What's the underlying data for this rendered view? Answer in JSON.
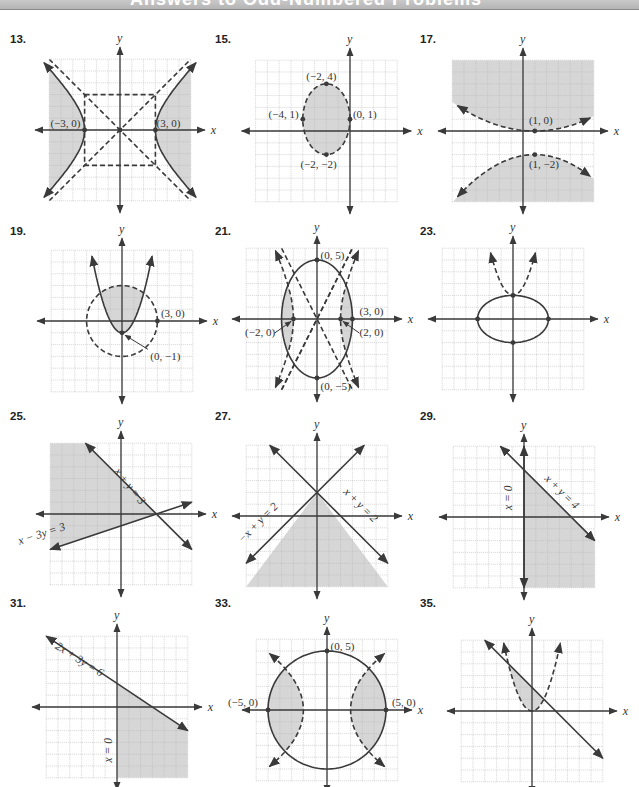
{
  "header": {
    "title": "Answers to Odd-Numbered Problems"
  },
  "colors": {
    "grid": "#b8b8b8",
    "axis": "#3a3a3a",
    "curve": "#3a3a3a",
    "shade": "#d6d6d6",
    "label": "#333333"
  },
  "chart_data": [
    {
      "id": "13",
      "type": "inequality-graph",
      "title": "13.",
      "panel": {
        "left": 10,
        "top": 33
      },
      "origin": [
        110,
        97
      ],
      "unit": 11.8,
      "grid": [
        -6,
        6,
        -6,
        6
      ],
      "xlabel": "x",
      "ylabel": "y",
      "description": "Hyperbola x^2/9 - y^2/b^2 = 1 (solid), shaded outside branches, dashed asymptote box and asymptotes",
      "points": [
        {
          "x": -3,
          "y": 0,
          "label": "(−3, 0)",
          "lx": -5.9,
          "ly": 0.25
        },
        {
          "x": 3,
          "y": 0,
          "label": "(3, 0)",
          "lx": 3.1,
          "ly": 0.25
        },
        {
          "x": 0,
          "y": 0,
          "label": ""
        }
      ]
    },
    {
      "id": "15",
      "type": "inequality-graph",
      "title": "15.",
      "panel": {
        "left": 215,
        "top": 33
      },
      "origin": [
        135,
        98
      ],
      "unit": 11.8,
      "grid": [
        -8,
        4,
        -6,
        6
      ],
      "xlabel": "x",
      "ylabel": "y",
      "description": "Dashed ellipse centered (-2,1), shaded interior",
      "points": [
        {
          "x": -2,
          "y": 4,
          "label": "(−2, 4)",
          "lx": -3.7,
          "ly": 4.3
        },
        {
          "x": -4,
          "y": 1,
          "label": "(−4, 1)",
          "lx": -6.9,
          "ly": 1.1
        },
        {
          "x": 0,
          "y": 1,
          "label": "(0, 1)",
          "lx": 0.25,
          "ly": 1.1
        },
        {
          "x": -2,
          "y": -2,
          "label": "(−2, −2)",
          "lx": -4.2,
          "ly": -3.1
        }
      ]
    },
    {
      "id": "17",
      "type": "inequality-graph",
      "title": "17.",
      "panel": {
        "left": 420,
        "top": 33
      },
      "origin": [
        103,
        98
      ],
      "unit": 11.8,
      "grid": [
        -6,
        6,
        -6,
        6
      ],
      "xlabel": "x",
      "ylabel": "y",
      "description": "Two dashed parabola-like curves; shaded above upper curve and below lower curve",
      "points": [
        {
          "x": 1,
          "y": 0,
          "label": "(1, 0)",
          "lx": 0.5,
          "ly": 0.6
        },
        {
          "x": 1,
          "y": -2,
          "label": "(1, −2)",
          "lx": 0.5,
          "ly": -3.1
        }
      ]
    },
    {
      "id": "19",
      "type": "inequality-graph",
      "title": "19.",
      "panel": {
        "left": 10,
        "top": 225
      },
      "origin": [
        112,
        96
      ],
      "unit": 11.8,
      "grid": [
        -6,
        6,
        -6,
        6
      ],
      "xlabel": "x",
      "ylabel": "y",
      "description": "Solid parabola y = x^2 - 1, dashed circle radius 3; shaded inside circle above parabola",
      "points": [
        {
          "x": 3,
          "y": 0,
          "label": "(3, 0)",
          "lx": 3.3,
          "ly": 0.3
        },
        {
          "x": 0,
          "y": -1,
          "label": "(0, −1)",
          "lx": 2.4,
          "ly": -3.3
        }
      ]
    },
    {
      "id": "21",
      "type": "inequality-graph",
      "title": "21.",
      "panel": {
        "left": 215,
        "top": 225
      },
      "origin": [
        102,
        94
      ],
      "unit": 11.8,
      "grid": [
        -6,
        6,
        -6,
        6
      ],
      "xlabel": "x",
      "ylabel": "y",
      "description": "Solid ellipse x^2/9 + y^2/25 = 1, dashed hyperbola branches through (±2,0); shaded regions between",
      "points": [
        {
          "x": 0,
          "y": 5,
          "label": "(0, 5)",
          "lx": 0.3,
          "ly": 5.1
        },
        {
          "x": 3,
          "y": 0,
          "label": "(3, 0)",
          "lx": 3.6,
          "ly": 0.3
        },
        {
          "x": -2,
          "y": 0,
          "label": "(−2, 0)",
          "lx": -6.1,
          "ly": -1.4
        },
        {
          "x": 2,
          "y": 0,
          "label": "(2, 0)",
          "lx": 3.6,
          "ly": -1.4
        },
        {
          "x": 0,
          "y": -5,
          "label": "(0, −5)",
          "lx": 0.3,
          "ly": -6.0
        }
      ]
    },
    {
      "id": "23",
      "type": "inequality-graph",
      "title": "23.",
      "panel": {
        "left": 420,
        "top": 225
      },
      "origin": [
        93,
        94
      ],
      "unit": 11.8,
      "grid": [
        -6,
        6,
        -6,
        6
      ],
      "xlabel": "x",
      "ylabel": "y",
      "description": "Solid ellipse x^2/9 + y^2/4 = 1, dashed parabola y = x^2 + 2 above",
      "points": [
        {
          "x": 0,
          "y": 2,
          "label": ""
        },
        {
          "x": -3,
          "y": 0,
          "label": ""
        },
        {
          "x": 3,
          "y": 0,
          "label": ""
        },
        {
          "x": 0,
          "y": -2,
          "label": ""
        }
      ]
    },
    {
      "id": "25",
      "type": "inequality-graph",
      "title": "25.",
      "panel": {
        "left": 10,
        "top": 410
      },
      "origin": [
        111,
        104
      ],
      "unit": 11.8,
      "grid": [
        -6,
        6,
        -6,
        6
      ],
      "xlabel": "x",
      "ylabel": "y",
      "description": "Solid lines x + y = 3 and x - 3y = 3; shaded left region below x+y=3 and above x-3y=3",
      "lines": [
        {
          "label": "x + y = 3",
          "a": 1,
          "b": 1,
          "c": 3
        },
        {
          "label": "x − 3y = 3",
          "a": 1,
          "b": -3,
          "c": 3
        }
      ]
    },
    {
      "id": "27",
      "type": "inequality-graph",
      "title": "27.",
      "panel": {
        "left": 215,
        "top": 410
      },
      "origin": [
        102,
        106
      ],
      "unit": 11.8,
      "grid": [
        -6,
        6,
        -6,
        6
      ],
      "xlabel": "x",
      "ylabel": "y",
      "description": "Solid lines -x + y = 2 and x + y = 2; shaded below both",
      "lines": [
        {
          "label": "−x + y = 2",
          "a": -1,
          "b": 1,
          "c": 2
        },
        {
          "label": "x + y = 2",
          "a": 1,
          "b": 1,
          "c": 2
        }
      ]
    },
    {
      "id": "29",
      "type": "inequality-graph",
      "title": "29.",
      "panel": {
        "left": 420,
        "top": 410
      },
      "origin": [
        104,
        107
      ],
      "unit": 11.8,
      "grid": [
        -6,
        6,
        -6,
        6
      ],
      "xlabel": "x",
      "ylabel": "y",
      "description": "Solid lines x = 0 and x + y = 4; shaded right of y-axis below x+y=4",
      "lines": [
        {
          "label": "x = 0",
          "a": 1,
          "b": 0,
          "c": 0
        },
        {
          "label": "x + y = 4",
          "a": 1,
          "b": 1,
          "c": 4
        }
      ]
    },
    {
      "id": "31",
      "type": "inequality-graph",
      "title": "31.",
      "panel": {
        "left": 10,
        "top": 597
      },
      "origin": [
        107,
        110
      ],
      "unit": 11.8,
      "grid": [
        -6,
        6,
        -6,
        6
      ],
      "xlabel": "x",
      "ylabel": "y",
      "description": "Solid lines 2x + 3y = 6 and x = 0; shaded right of y-axis below line",
      "lines": [
        {
          "label": "2x + 3y = 6",
          "a": 2,
          "b": 3,
          "c": 6
        },
        {
          "label": "x = 0",
          "a": 1,
          "b": 0,
          "c": 0
        }
      ]
    },
    {
      "id": "33",
      "type": "inequality-graph",
      "title": "33.",
      "panel": {
        "left": 215,
        "top": 597
      },
      "origin": [
        112,
        113
      ],
      "unit": 11.8,
      "grid": [
        -6,
        6,
        -6,
        6
      ],
      "xlabel": "x",
      "ylabel": "y",
      "description": "Solid circle radius 5, dashed parabolas x = ±(y^2/…)+…; shaded lens regions near (±5,0)",
      "points": [
        {
          "x": 0,
          "y": 5,
          "label": "(0, 5)",
          "lx": 0.3,
          "ly": 5.1
        },
        {
          "x": -5,
          "y": 0,
          "label": "(−5, 0)",
          "lx": -8.4,
          "ly": 0.3
        },
        {
          "x": 5,
          "y": 0,
          "label": "(5, 0)",
          "lx": 5.5,
          "ly": 0.3
        }
      ]
    },
    {
      "id": "35",
      "type": "inequality-graph",
      "title": "35.",
      "panel": {
        "left": 420,
        "top": 597
      },
      "origin": [
        112,
        114
      ],
      "unit": 11.8,
      "grid": [
        -6,
        6,
        -6,
        6
      ],
      "xlabel": "x",
      "ylabel": "y",
      "description": "Solid line x + y = 2, dashed parabola y = x^2; shaded between",
      "lines": [
        {
          "label": "",
          "a": 1,
          "b": 1,
          "c": 2
        }
      ]
    }
  ]
}
